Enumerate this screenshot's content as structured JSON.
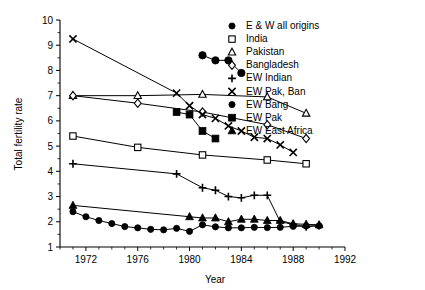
{
  "chart_data": {
    "type": "line",
    "title": "",
    "xlabel": "Year",
    "ylabel": "Total fertility rate",
    "xlim": [
      1970,
      1992
    ],
    "ylim": [
      1,
      10
    ],
    "xticks": [
      1972,
      1976,
      1980,
      1984,
      1988,
      1992
    ],
    "yticks": [
      1,
      2,
      3,
      4,
      5,
      6,
      7,
      8,
      9,
      10
    ],
    "xtick_labels": [
      "1972",
      "1976",
      "1980",
      "1984",
      "1988",
      "1992"
    ],
    "ytick_labels": [
      "1",
      "2",
      "3",
      "4",
      "5",
      "6",
      "7",
      "8",
      "9",
      "10"
    ],
    "x_minor_step": 1,
    "grid": false,
    "legend_position": "right",
    "series": [
      {
        "name": "E & W all origins",
        "marker": "filled-circle",
        "x": [
          1971,
          1972,
          1973,
          1974,
          1975,
          1976,
          1977,
          1978,
          1979,
          1980,
          1981,
          1982,
          1983,
          1984,
          1985,
          1986,
          1987,
          1988,
          1989,
          1990
        ],
        "values": [
          2.4,
          2.2,
          2.05,
          1.93,
          1.81,
          1.76,
          1.7,
          1.68,
          1.74,
          1.62,
          1.88,
          1.8,
          1.76,
          1.76,
          1.78,
          1.77,
          1.78,
          1.82,
          1.83,
          1.84
        ]
      },
      {
        "name": "India",
        "marker": "open-square",
        "x": [
          1971,
          1976,
          1981,
          1986,
          1989
        ],
        "values": [
          5.4,
          4.95,
          4.65,
          4.45,
          4.3
        ]
      },
      {
        "name": "Pakistan",
        "marker": "open-triangle",
        "x": [
          1971,
          1976,
          1981,
          1986,
          1989
        ],
        "values": [
          7.0,
          7.0,
          7.05,
          6.95,
          6.3
        ]
      },
      {
        "name": "Bangladesh",
        "marker": "open-diamond",
        "x": [
          1971,
          1976,
          1981,
          1986,
          1989
        ],
        "values": [
          7.0,
          6.7,
          6.35,
          5.85,
          5.3
        ]
      },
      {
        "name": "EW Indian",
        "marker": "plus",
        "x": [
          1971,
          1979,
          1981,
          1982,
          1983,
          1984,
          1985,
          1986,
          1987,
          1988,
          1989,
          1990
        ],
        "values": [
          4.3,
          3.9,
          3.35,
          3.25,
          3.0,
          2.95,
          3.05,
          3.05,
          2.0,
          1.9,
          1.8,
          1.85
        ]
      },
      {
        "name": "EW Pak, Ban",
        "marker": "cross",
        "x": [
          1971,
          1979,
          1980,
          1981,
          1982,
          1983,
          1984,
          1985,
          1986,
          1987,
          1988
        ],
        "values": [
          9.25,
          7.1,
          6.6,
          6.25,
          6.1,
          5.8,
          5.6,
          5.35,
          5.3,
          5.05,
          4.75
        ]
      },
      {
        "name": "EW Bang",
        "marker": "filled-circle-lg",
        "x": [
          1981,
          1982,
          1983,
          1984
        ],
        "values": [
          8.6,
          8.4,
          8.4,
          7.9
        ]
      },
      {
        "name": "EW Pak",
        "marker": "filled-square",
        "x": [
          1979,
          1980,
          1981,
          1982
        ],
        "values": [
          6.35,
          6.25,
          5.6,
          5.3
        ]
      },
      {
        "name": "EW East Africa",
        "marker": "filled-triangle",
        "x": [
          1971,
          1980,
          1981,
          1982,
          1983,
          1984,
          1985,
          1986,
          1987,
          1988,
          1989,
          1990
        ],
        "values": [
          2.65,
          2.2,
          2.15,
          2.15,
          2.0,
          2.1,
          2.1,
          2.05,
          2.05,
          1.92,
          1.9,
          1.88
        ]
      }
    ]
  },
  "legend": {
    "items": [
      {
        "label": "E & W all origins",
        "marker": "filled-circle"
      },
      {
        "label": "India",
        "marker": "open-square"
      },
      {
        "label": "Pakistan",
        "marker": "open-triangle"
      },
      {
        "label": "Bangladesh",
        "marker": "open-diamond"
      },
      {
        "label": "EW Indian",
        "marker": "plus"
      },
      {
        "label": "EW Pak, Ban",
        "marker": "cross"
      },
      {
        "label": "EW Bang",
        "marker": "filled-circle"
      },
      {
        "label": "EW Pak",
        "marker": "filled-square"
      },
      {
        "label": "EW East Africa",
        "marker": "filled-triangle"
      }
    ]
  },
  "colors": {
    "ink": "#000000",
    "background": "#ffffff"
  }
}
